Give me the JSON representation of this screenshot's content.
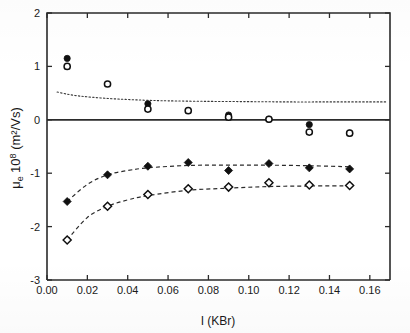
{
  "figure": {
    "background": "#ffffff",
    "ink_color": "#1a1a1a"
  },
  "chart_data": {
    "type": "scatter",
    "title": "",
    "xlabel": "I (KBr)",
    "ylabel": "μ_e 10⁸ (m²/Vs)",
    "ylabel_parts": {
      "mu": "μ",
      "sub": "e",
      "ten": "10",
      "exp": "8",
      "units": "(m2/Vs)",
      "units_display": "(m²/Vs)"
    },
    "xlim": [
      0.0,
      0.17
    ],
    "ylim": [
      -3,
      2
    ],
    "xticks": [
      0.0,
      0.02,
      0.04,
      0.06,
      0.08,
      0.1,
      0.12,
      0.14,
      0.16
    ],
    "xtick_labels": [
      "0.00",
      "0.02",
      "0.04",
      "0.06",
      "0.08",
      "0.10",
      "0.12",
      "0.14",
      "0.16"
    ],
    "yticks": [
      2,
      1,
      0,
      -1,
      -2,
      -3
    ],
    "ytick_labels": [
      "2",
      "1",
      "0",
      "-1",
      "-2",
      "-3"
    ],
    "grid": false,
    "legend": "none",
    "zero_line": 0,
    "x": [
      0.01,
      0.03,
      0.05,
      0.07,
      0.09,
      0.11,
      0.13,
      0.15
    ],
    "series": [
      {
        "name": "upper-filled-circles",
        "marker": "filled-circle",
        "x": [
          0.01,
          0.05,
          0.09,
          0.11,
          0.13,
          0.15
        ],
        "values": [
          1.15,
          0.3,
          0.09,
          0.01,
          -0.09,
          -0.25
        ]
      },
      {
        "name": "upper-open-circles",
        "marker": "open-circle",
        "x": [
          0.01,
          0.03,
          0.05,
          0.07,
          0.09,
          0.11,
          0.13,
          0.15
        ],
        "values": [
          1.0,
          0.67,
          0.2,
          0.17,
          0.05,
          0.01,
          -0.23,
          -0.25
        ]
      },
      {
        "name": "lower-filled-diamonds",
        "marker": "filled-diamond",
        "x": [
          0.01,
          0.03,
          0.05,
          0.07,
          0.09,
          0.11,
          0.13,
          0.15
        ],
        "values": [
          -1.53,
          -1.03,
          -0.87,
          -0.8,
          -0.95,
          -0.82,
          -0.9,
          -0.92
        ]
      },
      {
        "name": "lower-open-diamonds",
        "marker": "open-diamond",
        "x": [
          0.01,
          0.03,
          0.05,
          0.07,
          0.09,
          0.11,
          0.13,
          0.15
        ],
        "values": [
          -2.25,
          -1.62,
          -1.4,
          -1.29,
          -1.26,
          -1.18,
          -1.22,
          -1.23
        ]
      }
    ],
    "curves": [
      {
        "name": "upper-dotted-theory-curve",
        "style": "dotted",
        "x": [
          0.005,
          0.01,
          0.015,
          0.02,
          0.03,
          0.04,
          0.05,
          0.06,
          0.08,
          0.1,
          0.12,
          0.14,
          0.16,
          0.168
        ],
        "values": [
          0.52,
          0.48,
          0.45,
          0.43,
          0.4,
          0.38,
          0.365,
          0.355,
          0.345,
          0.34,
          0.335,
          0.335,
          0.335,
          0.335
        ]
      },
      {
        "name": "lower-upper-dashed-fit",
        "style": "dashed",
        "x": [
          0.01,
          0.02,
          0.03,
          0.04,
          0.05,
          0.07,
          0.09,
          0.11,
          0.13,
          0.15
        ],
        "values": [
          -1.53,
          -1.21,
          -1.03,
          -0.95,
          -0.9,
          -0.855,
          -0.85,
          -0.85,
          -0.86,
          -0.88
        ]
      },
      {
        "name": "lower-lower-dashed-fit",
        "style": "dashed",
        "x": [
          0.01,
          0.02,
          0.03,
          0.04,
          0.05,
          0.07,
          0.09,
          0.11,
          0.13,
          0.15
        ],
        "values": [
          -2.25,
          -1.83,
          -1.62,
          -1.5,
          -1.42,
          -1.32,
          -1.28,
          -1.25,
          -1.24,
          -1.235
        ]
      }
    ]
  }
}
